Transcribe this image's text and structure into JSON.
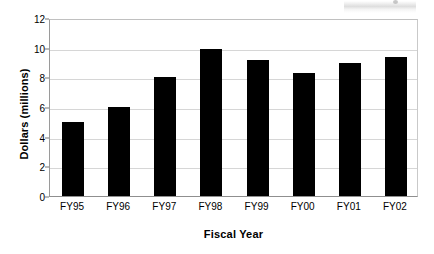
{
  "chart_data": {
    "type": "bar",
    "title": "",
    "xlabel": "Fiscal Year",
    "ylabel": "Dollars (millions)",
    "categories": [
      "FY95",
      "FY96",
      "FY97",
      "FY98",
      "FY99",
      "FY00",
      "FY01",
      "FY02"
    ],
    "values": [
      5.0,
      6.0,
      8.0,
      9.9,
      9.15,
      8.3,
      9.0,
      9.4
    ],
    "ylim": [
      0,
      12
    ],
    "yticks": [
      0,
      2,
      4,
      6,
      8,
      10,
      12
    ],
    "ytick_labels": [
      "0",
      "2",
      "4",
      "6",
      "8",
      "10",
      "12"
    ],
    "grid": true,
    "legend": false,
    "bar_color": "#000000",
    "grid_color": "#d6d6d6",
    "axis_color": "#8f8f8f",
    "background": "#ffffff"
  }
}
